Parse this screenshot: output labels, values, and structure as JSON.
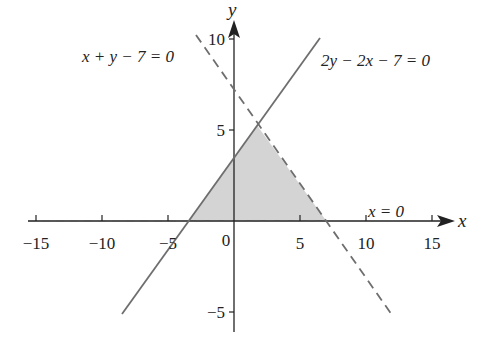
{
  "diagram": {
    "type": "linear-inequality-region",
    "axes": {
      "x_label": "x",
      "y_label": "y",
      "origin_label": "0",
      "x_ticks": [
        {
          "value": -15,
          "label": "−15"
        },
        {
          "value": -10,
          "label": "−10"
        },
        {
          "value": -5,
          "label": "−5"
        },
        {
          "value": 5,
          "label": "5"
        },
        {
          "value": 10,
          "label": "10"
        },
        {
          "value": 15,
          "label": "15"
        }
      ],
      "y_ticks": [
        {
          "value": 10,
          "label": "10"
        },
        {
          "value": 5,
          "label": "5"
        },
        {
          "value": -5,
          "label": "−5"
        }
      ],
      "x_range": [
        -16,
        16
      ],
      "y_range": [
        -6,
        11
      ]
    },
    "lines": [
      {
        "id": "dashed-line",
        "equation": "x + y − 7 = 0",
        "style": "dashed",
        "from": [
          -2.9,
          10.2
        ],
        "to": [
          12,
          -5
        ]
      },
      {
        "id": "solid-line",
        "equation": "2y − 2x − 7 = 0",
        "style": "solid",
        "from": [
          -8.5,
          -5
        ],
        "to": [
          6.5,
          10
        ]
      },
      {
        "id": "axis-line",
        "equation": "x = 0",
        "style": "dashed",
        "from": [
          -15,
          0
        ],
        "to": [
          15,
          0
        ]
      }
    ],
    "shaded_region": {
      "vertices": [
        [
          -3.5,
          0
        ],
        [
          1.75,
          5.25
        ],
        [
          7,
          0
        ]
      ],
      "color": "#d4d4d4"
    },
    "labels": {
      "dashed_eq": "x + y − 7 = 0",
      "solid_eq": "2y − 2x − 7 = 0",
      "axis_eq": "x = 0"
    },
    "colors": {
      "axis": "#222222",
      "line": "#6e6e6e",
      "shade": "#d4d4d4"
    }
  }
}
